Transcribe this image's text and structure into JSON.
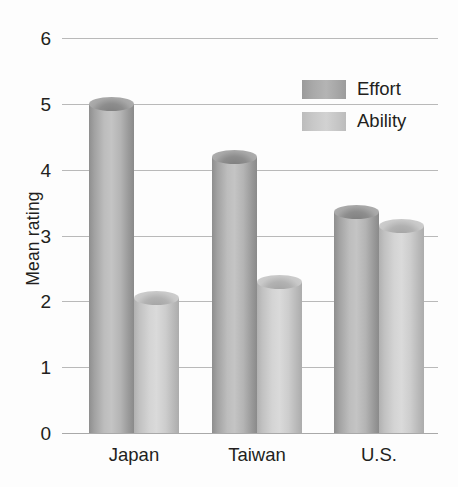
{
  "chart_data": {
    "type": "bar",
    "title": "",
    "xlabel": "",
    "ylabel": "Mean rating",
    "categories": [
      "Japan",
      "Taiwan",
      "U.S."
    ],
    "ylim": [
      0,
      6
    ],
    "yticks": [
      0,
      1,
      2,
      3,
      4,
      5,
      6
    ],
    "ytick_labels": [
      "0",
      "1",
      "2",
      "3",
      "4",
      "5",
      "6"
    ],
    "grid": true,
    "legend_position": "upper right",
    "series": [
      {
        "name": "Effort",
        "color": "#a8a8a8",
        "values": [
          5.0,
          4.2,
          3.35
        ]
      },
      {
        "name": "Ability",
        "color": "#c8c8c8",
        "values": [
          2.05,
          2.3,
          3.15
        ]
      }
    ]
  },
  "axes": {
    "y_title": "Mean rating",
    "y_tick_0": "0",
    "y_tick_1": "1",
    "y_tick_2": "2",
    "y_tick_3": "3",
    "y_tick_4": "4",
    "y_tick_5": "5",
    "y_tick_6": "6",
    "x_cat_0": "Japan",
    "x_cat_1": "Taiwan",
    "x_cat_2": "U.S."
  },
  "legend": {
    "items": [
      {
        "label": "Effort"
      },
      {
        "label": "Ability"
      }
    ]
  }
}
